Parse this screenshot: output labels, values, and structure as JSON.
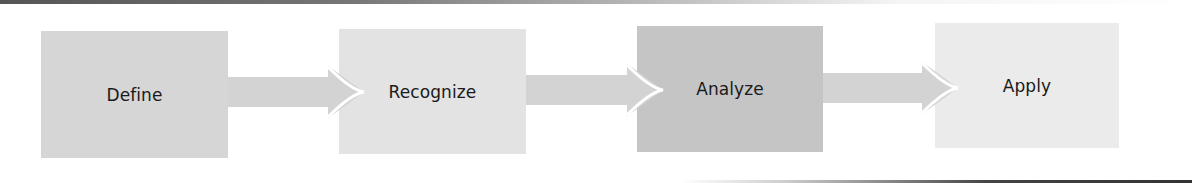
{
  "diagram": {
    "type": "process-flow",
    "steps": [
      {
        "label": "Define",
        "color": "#d6d6d6"
      },
      {
        "label": "Recognize",
        "color": "#e3e3e3"
      },
      {
        "label": "Analyze",
        "color": "#c5c5c5"
      },
      {
        "label": "Apply",
        "color": "#ebebeb"
      }
    ],
    "connector_color": "#d3d3d3",
    "connectors": [
      "Define→Recognize",
      "Recognize→Analyze",
      "Analyze→Apply"
    ]
  }
}
